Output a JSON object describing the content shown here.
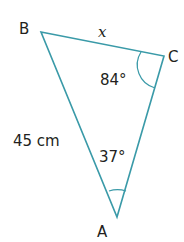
{
  "diagram": {
    "type": "triangle",
    "line_color": "#3a9aa8",
    "text_color": "#231f20",
    "vertices": {
      "B": {
        "label": "B",
        "x": 41,
        "y": 32
      },
      "C": {
        "label": "C",
        "x": 164,
        "y": 56
      },
      "A": {
        "label": "A",
        "x": 117,
        "y": 217
      }
    },
    "sides": {
      "BC": {
        "label": "x"
      },
      "AB": {
        "label": "45 cm"
      }
    },
    "angles": {
      "C": {
        "label": "84°"
      },
      "A": {
        "label": "37°"
      }
    }
  }
}
